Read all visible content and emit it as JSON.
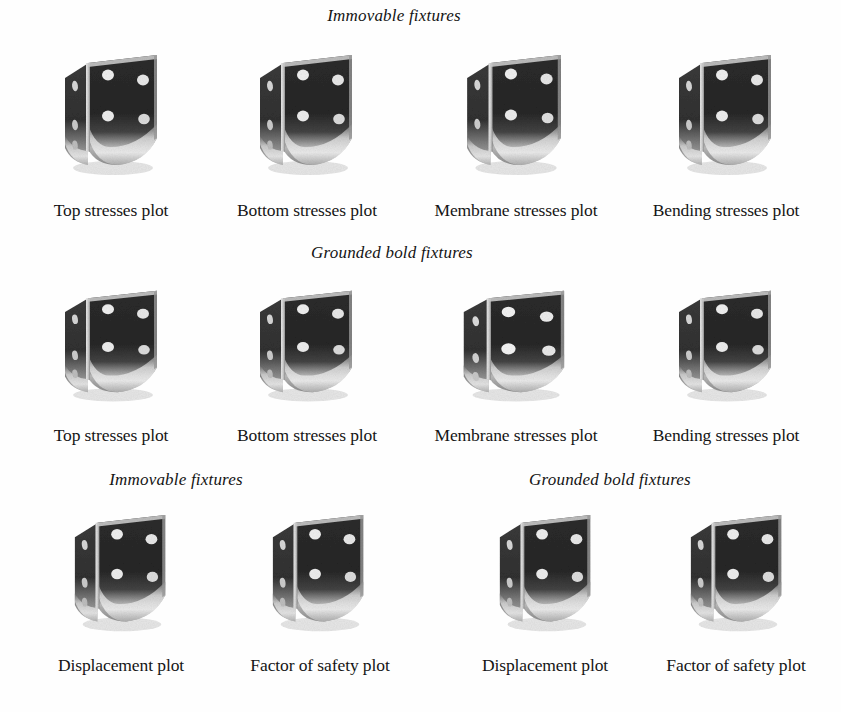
{
  "page": {
    "background_color": "#fefefe",
    "text_color": "#151515"
  },
  "sections": [
    {
      "id": "row1",
      "headers": [
        {
          "text": "Immovable fixtures",
          "cx": 394,
          "y": 6
        }
      ],
      "items": [
        {
          "caption": "Top stresses plot",
          "cx": 111,
          "img_x": 57,
          "img_y": 52,
          "img_w": 110,
          "img_h": 128,
          "variant": "a"
        },
        {
          "caption": "Bottom stresses plot",
          "cx": 307,
          "img_x": 252,
          "img_y": 52,
          "img_w": 110,
          "img_h": 128,
          "variant": "a"
        },
        {
          "caption": "Membrane stresses plot",
          "cx": 516,
          "img_x": 459,
          "img_y": 52,
          "img_w": 112,
          "img_h": 128,
          "variant": "b"
        },
        {
          "caption": "Bending stresses plot",
          "cx": 726,
          "img_x": 671,
          "img_y": 52,
          "img_w": 110,
          "img_h": 128,
          "variant": "a"
        }
      ],
      "caption_y": 200
    },
    {
      "id": "row2",
      "headers": [
        {
          "text": "Grounded bold fixtures",
          "cx": 392,
          "y": 243
        }
      ],
      "items": [
        {
          "caption": "Top stresses plot",
          "cx": 111,
          "img_x": 57,
          "img_y": 288,
          "img_w": 110,
          "img_h": 118,
          "variant": "a"
        },
        {
          "caption": "Bottom stresses plot",
          "cx": 307,
          "img_x": 252,
          "img_y": 288,
          "img_w": 110,
          "img_h": 118,
          "variant": "a"
        },
        {
          "caption": "Membrane stresses plot",
          "cx": 516,
          "img_x": 455,
          "img_y": 288,
          "img_w": 120,
          "img_h": 118,
          "variant": "c"
        },
        {
          "caption": "Bending stresses plot",
          "cx": 726,
          "img_x": 671,
          "img_y": 288,
          "img_w": 110,
          "img_h": 118,
          "variant": "a"
        }
      ],
      "caption_y": 425
    },
    {
      "id": "row3",
      "headers": [
        {
          "text": "Immovable fixtures",
          "cx": 176,
          "y": 470
        },
        {
          "text": "Grounded bold fixtures",
          "cx": 610,
          "y": 470
        }
      ],
      "items": [
        {
          "caption": "Displacement plot",
          "cx": 121,
          "img_x": 67,
          "img_y": 512,
          "img_w": 108,
          "img_h": 124,
          "variant": "a"
        },
        {
          "caption": "Factor of safety plot",
          "cx": 320,
          "img_x": 265,
          "img_y": 512,
          "img_w": 108,
          "img_h": 124,
          "variant": "a"
        },
        {
          "caption": "Displacement plot",
          "cx": 545,
          "img_x": 492,
          "img_y": 512,
          "img_w": 108,
          "img_h": 124,
          "variant": "a"
        },
        {
          "caption": "Factor of safety plot",
          "cx": 736,
          "img_x": 683,
          "img_y": 512,
          "img_w": 108,
          "img_h": 124,
          "variant": "a"
        }
      ],
      "caption_y": 655
    }
  ],
  "figure_semantics": {
    "subject": "L-shaped perforated metal corner bracket",
    "render_type": "grayscale-photograph"
  }
}
